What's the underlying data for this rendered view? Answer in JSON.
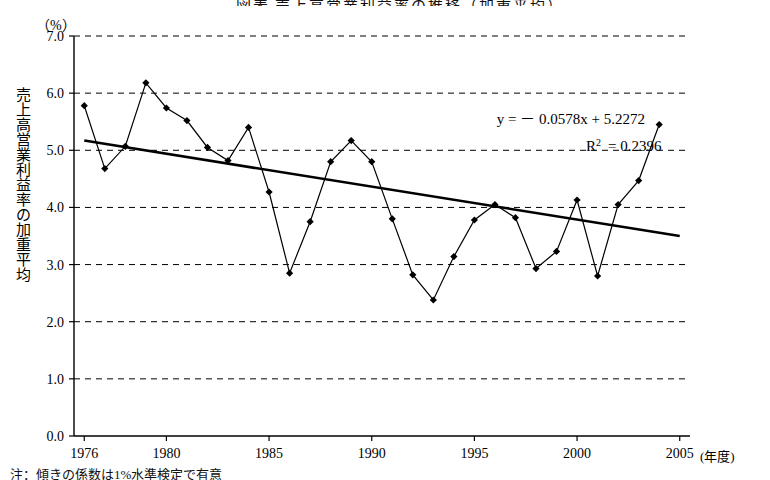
{
  "title": "図表 売上高営業利益率の推移（加重平均）",
  "axes": {
    "unit_label": "（%）",
    "ylabel_chars": [
      "売",
      "上",
      "高",
      "営",
      "業",
      "利",
      "益",
      "率",
      "の",
      "加",
      "重",
      "平",
      "均"
    ],
    "x_unit": "(年度)",
    "y_ticks": [
      "0.0",
      "1.0",
      "2.0",
      "3.0",
      "4.0",
      "5.0",
      "6.0",
      "7.0"
    ],
    "x_ticks": [
      "1976",
      "1980",
      "1985",
      "1990",
      "1995",
      "2000",
      "2005"
    ]
  },
  "annotations": {
    "equation": "y = － 0.0578x + 5.2272",
    "r_squared_prefix": "R",
    "r_squared_exp": "2",
    "r_squared_value": "= 0.2396"
  },
  "footnote": "注：傾きの係数は1%水準検定で有意",
  "chart_data": {
    "type": "line",
    "title": "売上高営業利益率の推移（加重平均）",
    "xlabel": "(年度)",
    "ylabel": "売上高営業利益率の加重平均",
    "yunit": "(%)",
    "xlim": [
      1975.5,
      2005.5
    ],
    "ylim": [
      0.0,
      7.0
    ],
    "ytick_step": 1.0,
    "grid": "horizontal-dashed",
    "legend": "none",
    "marker": "diamond",
    "series": [
      {
        "name": "売上高営業利益率（加重平均）",
        "x": [
          1976,
          1977,
          1978,
          1979,
          1980,
          1981,
          1982,
          1983,
          1984,
          1985,
          1986,
          1987,
          1988,
          1989,
          1990,
          1991,
          1992,
          1993,
          1994,
          1995,
          1996,
          1997,
          1998,
          1999,
          2000,
          2001,
          2002,
          2003,
          2004
        ],
        "values": [
          5.78,
          4.68,
          5.07,
          6.18,
          5.74,
          5.52,
          5.05,
          4.82,
          5.4,
          4.27,
          2.85,
          3.75,
          4.8,
          5.17,
          4.8,
          3.8,
          2.82,
          2.38,
          3.14,
          3.78,
          4.05,
          3.82,
          2.93,
          3.23,
          4.13,
          2.8,
          4.05,
          4.47,
          5.45
        ]
      }
    ],
    "trendline": {
      "equation": "y = -0.0578x + 5.2272",
      "r_squared": 0.2396,
      "x_start": 1976,
      "x_end": 2005,
      "y_start": 5.17,
      "y_end": 3.5
    }
  }
}
